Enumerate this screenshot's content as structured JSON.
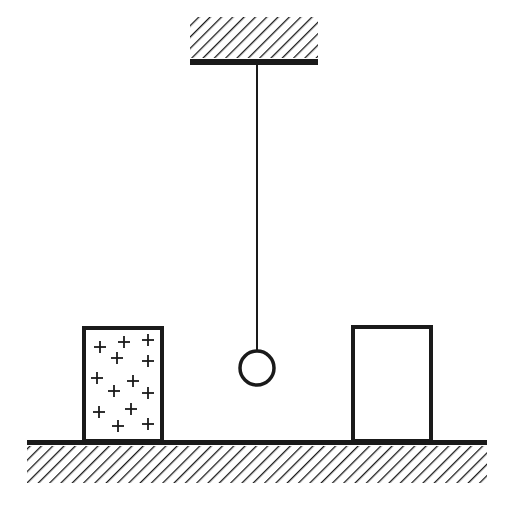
{
  "diagram": {
    "ceiling": {
      "type": "hatched-support"
    },
    "pendulum": {
      "type": "string-and-ball",
      "ball": "hollow"
    },
    "left_block": {
      "charge_symbol": "+",
      "charge_count": 13
    },
    "right_block": {
      "charge_symbol": "",
      "charge_count": 0
    },
    "ground": {
      "type": "hatched-surface"
    },
    "colors": {
      "stroke": "#1a1a1a",
      "background": "#ffffff"
    }
  }
}
